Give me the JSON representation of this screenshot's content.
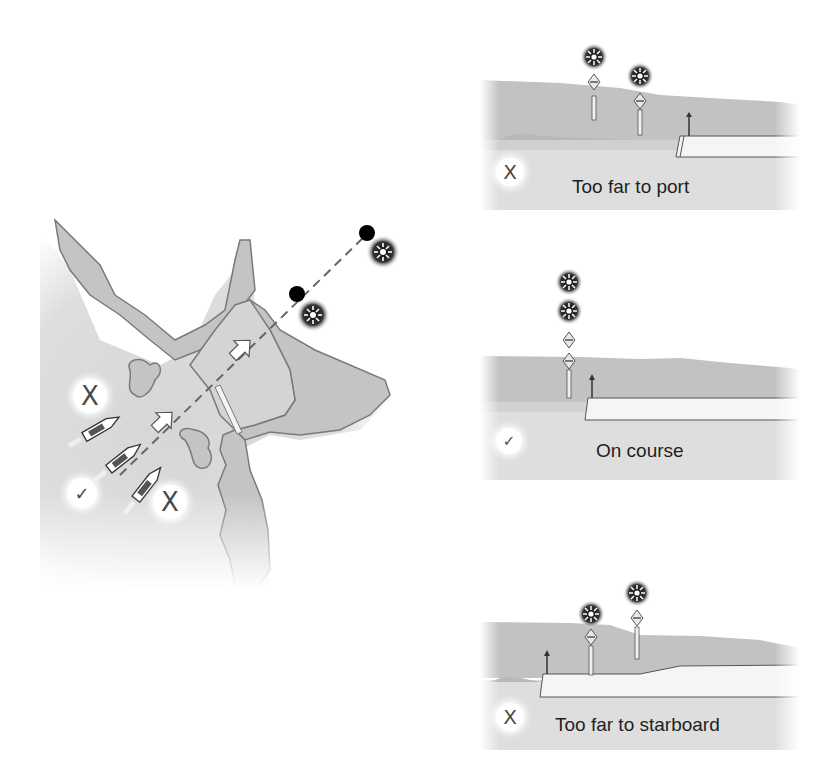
{
  "figure": {
    "colors": {
      "water": "#dcdcdc",
      "land": "#c8c8c8",
      "outline": "#7a7a7a",
      "light_halo": "#2a2a2a",
      "text": "#1e1e1e"
    }
  },
  "map": {
    "boats": [
      {
        "id": "boat-port",
        "status": "wrong",
        "mark": "X"
      },
      {
        "id": "boat-center",
        "status": "correct",
        "mark": "✓"
      },
      {
        "id": "boat-starboard",
        "status": "wrong",
        "mark": "X"
      }
    ],
    "marks": {
      "top_left": "X",
      "bottom_left": "✓",
      "bottom_right": "X"
    },
    "leading_lights": [
      "front light",
      "rear light"
    ]
  },
  "panels": [
    {
      "id": "port",
      "caption": "Too far to port",
      "mark": "X",
      "status": "wrong"
    },
    {
      "id": "on-course",
      "caption": "On course",
      "mark": "✓",
      "status": "correct"
    },
    {
      "id": "starboard",
      "caption": "Too far to starboard",
      "mark": "X",
      "status": "wrong"
    }
  ]
}
